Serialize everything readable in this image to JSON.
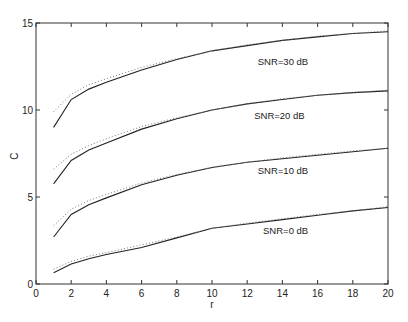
{
  "chart_data": {
    "type": "line",
    "title": "",
    "xlabel": "r",
    "ylabel": "C",
    "xlim": [
      0,
      20
    ],
    "ylim": [
      0,
      15
    ],
    "xticks": [
      0,
      2,
      4,
      6,
      8,
      10,
      12,
      14,
      16,
      18,
      20
    ],
    "yticks": [
      0,
      5,
      10,
      15
    ],
    "grid": false,
    "legend": "none (inline annotations)",
    "x": [
      1,
      2,
      3,
      4,
      6,
      8,
      10,
      12,
      14,
      16,
      18,
      20
    ],
    "series": [
      {
        "name": "SNR=30 dB exact",
        "style": "solid",
        "values": [
          9.0,
          10.6,
          11.2,
          11.6,
          12.3,
          12.9,
          13.4,
          13.7,
          14.0,
          14.2,
          14.4,
          14.5
        ]
      },
      {
        "name": "SNR=30 dB approx",
        "style": "dotted",
        "values": [
          9.9,
          10.9,
          11.45,
          11.8,
          12.45,
          12.95,
          13.4,
          13.75,
          14.0,
          14.25,
          14.4,
          14.55
        ]
      },
      {
        "name": "SNR=20 dB exact",
        "style": "solid",
        "values": [
          5.75,
          7.1,
          7.7,
          8.1,
          8.9,
          9.5,
          10.0,
          10.35,
          10.6,
          10.85,
          11.0,
          11.1
        ]
      },
      {
        "name": "SNR=20 dB approx",
        "style": "dotted",
        "values": [
          6.6,
          7.45,
          7.95,
          8.35,
          9.05,
          9.55,
          10.0,
          10.35,
          10.65,
          10.85,
          11.0,
          11.15
        ]
      },
      {
        "name": "SNR=10 dB exact",
        "style": "solid",
        "values": [
          2.7,
          4.0,
          4.55,
          4.95,
          5.7,
          6.25,
          6.7,
          7.0,
          7.2,
          7.4,
          7.6,
          7.8
        ]
      },
      {
        "name": "SNR=10 dB approx",
        "style": "dotted",
        "values": [
          3.35,
          4.3,
          4.8,
          5.15,
          5.8,
          6.3,
          6.7,
          7.0,
          7.25,
          7.45,
          7.65,
          7.8
        ]
      },
      {
        "name": "SNR=0 dB exact",
        "style": "solid",
        "values": [
          0.65,
          1.15,
          1.45,
          1.7,
          2.1,
          2.65,
          3.2,
          3.45,
          3.7,
          3.95,
          4.2,
          4.4
        ]
      },
      {
        "name": "SNR=0 dB approx",
        "style": "dotted",
        "values": [
          0.85,
          1.3,
          1.6,
          1.8,
          2.25,
          2.7,
          3.2,
          3.5,
          3.75,
          4.0,
          4.2,
          4.45
        ]
      }
    ],
    "annotations": [
      {
        "text": "SNR=30 dB",
        "x": 12.6,
        "y": 12.6
      },
      {
        "text": "SNR=20 dB",
        "x": 12.4,
        "y": 9.5
      },
      {
        "text": "SNR=10 dB",
        "x": 12.6,
        "y": 6.3
      },
      {
        "text": "SNR=0 dB",
        "x": 12.9,
        "y": 2.85
      }
    ]
  },
  "axes": {
    "xlabel": "r",
    "ylabel": "C"
  }
}
